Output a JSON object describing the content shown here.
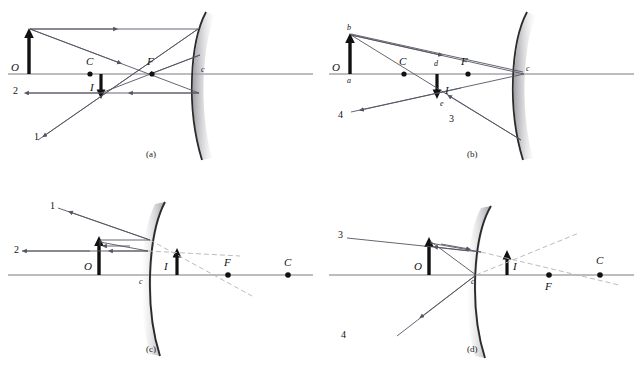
{
  "figure": {
    "colors": {
      "ray": "#555563",
      "axis": "#6b6b73",
      "object": "#111111",
      "mirror": "#2b2b2b",
      "mirror_shadow": "#a9a9ad",
      "dashed": "#b4b4b8",
      "label": "#111111"
    }
  },
  "panels": [
    {
      "id": "a",
      "caption": "(a)",
      "mirror_type": "concave",
      "labels": {
        "object": "O",
        "image": "I",
        "center": "C",
        "focus": "F",
        "vertex": "c",
        "ray_one": "1",
        "ray_two": "2"
      }
    },
    {
      "id": "b",
      "caption": "(b)",
      "mirror_type": "concave",
      "labels": {
        "object": "O",
        "image": "I",
        "center": "C",
        "focus": "F",
        "vertex": "c",
        "point_a": "a",
        "point_b": "b",
        "point_d": "d",
        "point_e": "e",
        "ray_three": "3",
        "ray_four": "4"
      }
    },
    {
      "id": "c",
      "caption": "(c)",
      "mirror_type": "convex",
      "labels": {
        "object": "O",
        "image": "I",
        "center": "C",
        "focus": "F",
        "vertex": "c",
        "ray_one": "1",
        "ray_two": "2"
      }
    },
    {
      "id": "d",
      "caption": "(d)",
      "mirror_type": "convex",
      "labels": {
        "object": "O",
        "image": "I",
        "center": "C",
        "focus": "F",
        "vertex": "c",
        "ray_three": "3",
        "ray_four": "4"
      }
    }
  ]
}
